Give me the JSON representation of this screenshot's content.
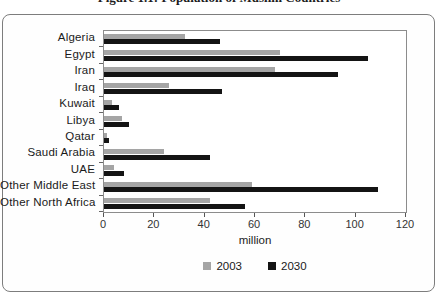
{
  "title": "Figure 1.1: Population of Muslim Countries",
  "chart_data": {
    "type": "bar",
    "orientation": "horizontal",
    "title": "Figure 1.1: Population of Muslim Countries",
    "categories": [
      "Algeria",
      "Egypt",
      "Iran",
      "Iraq",
      "Kuwait",
      "Libya",
      "Qatar",
      "Saudi Arabia",
      "UAE",
      "Other Middle East",
      "Other North Africa"
    ],
    "series": [
      {
        "name": "2003",
        "color": "#a5a5a5",
        "values": [
          32,
          70,
          68,
          26,
          3,
          7,
          1,
          24,
          4,
          59,
          42
        ]
      },
      {
        "name": "2030",
        "color": "#141414",
        "values": [
          46,
          105,
          93,
          47,
          6,
          10,
          2,
          42,
          8,
          109,
          56
        ]
      }
    ],
    "xlabel": "million",
    "ylabel": "",
    "xlim": [
      0,
      120
    ],
    "xticks": [
      0,
      20,
      40,
      60,
      80,
      100,
      120
    ],
    "grid": false,
    "legend_position": "bottom"
  },
  "colors": {
    "bar_2003": "#a5a5a5",
    "bar_2030": "#141414",
    "plot_border": "#8c8c8c",
    "outer_border": "#7d7d7d",
    "text": "#1a1a1a"
  }
}
